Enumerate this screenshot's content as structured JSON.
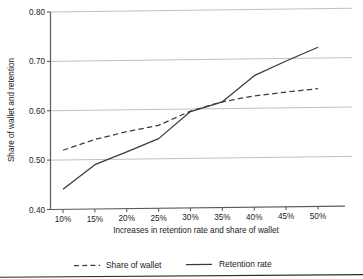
{
  "chart_data": {
    "type": "line",
    "title": "",
    "xlabel": "Increases in retention rate and share of wallet",
    "ylabel": "Share of wallet and retention",
    "x": [
      "10%",
      "15%",
      "20%",
      "25%",
      "30%",
      "35%",
      "40%",
      "45%",
      "50%"
    ],
    "xticklabels": [
      "10%",
      "15%",
      "20%",
      "25%",
      "30%",
      "35%",
      "40%",
      "45%",
      "50%"
    ],
    "yticklabels": [
      "0.80",
      "0.70",
      "0.60",
      "0.50",
      "0.40"
    ],
    "yticks": [
      0.8,
      0.7,
      0.6,
      0.5,
      0.4
    ],
    "ylim": [
      0.4,
      0.8
    ],
    "grid": "horizontal",
    "legend_position": "bottom",
    "series": [
      {
        "name": "Share of wallet",
        "style": "dashed",
        "color": "#3b3b3b",
        "values": [
          0.52,
          0.541,
          0.556,
          0.568,
          0.596,
          0.614,
          0.625,
          0.632,
          0.638
        ]
      },
      {
        "name": "Retention rate",
        "style": "solid",
        "color": "#3b3b3b",
        "values": [
          0.441,
          0.49,
          0.515,
          0.541,
          0.595,
          0.614,
          0.666,
          0.695,
          0.722
        ]
      }
    ]
  },
  "legend": {
    "items": [
      {
        "label": "Share of wallet",
        "style": "dashed"
      },
      {
        "label": "Retention rate",
        "style": "solid"
      }
    ]
  },
  "axes": {
    "x_title": "Increases in retention rate and share of wallet",
    "y_title": "Share of wallet and retention"
  },
  "colors": {
    "line": "#3b3b3b",
    "grid": "#b9b9b9",
    "axis": "#5a5a5a",
    "text": "#1a1a1a",
    "background": "#ffffff"
  }
}
